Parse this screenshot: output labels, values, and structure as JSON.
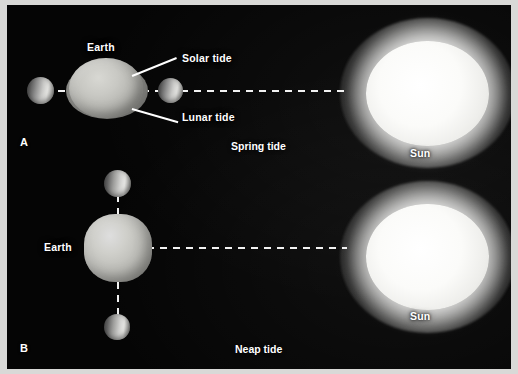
{
  "figure": {
    "background_color": "#050505",
    "border_color": "#d9d9d7",
    "text_color": "#ffffff"
  },
  "panels": [
    {
      "letter": "A",
      "caption": "Spring tide",
      "bodies": {
        "earth_label": "Earth",
        "sun_label": "Sun"
      },
      "callouts": [
        {
          "label": "Solar tide"
        },
        {
          "label": "Lunar tide"
        }
      ],
      "description": "Sun, Earth and Moon aligned; solar and lunar tidal bulges add together"
    },
    {
      "letter": "B",
      "caption": "Neap tide",
      "bodies": {
        "earth_label": "Earth",
        "sun_label": "Sun"
      },
      "callouts": [],
      "description": "Moon at right angles to the Sun-Earth line; tidal bulges partly cancel"
    }
  ],
  "labels": {
    "earth": "Earth",
    "sun": "Sun",
    "solar_tide": "Solar tide",
    "lunar_tide": "Lunar tide",
    "spring_tide": "Spring tide",
    "neap_tide": "Neap tide",
    "panel_a": "A",
    "panel_b": "B"
  }
}
